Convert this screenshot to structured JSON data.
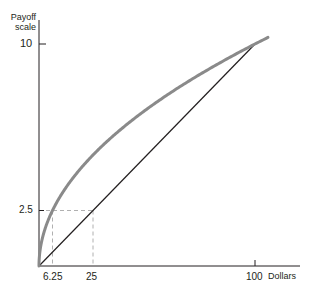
{
  "chart_data": {
    "type": "line",
    "title": "",
    "xlabel": "Dollars",
    "ylabel": "Payoff scale",
    "ylabel_lines": [
      "Payoff",
      "scale"
    ],
    "xlim": [
      0,
      106
    ],
    "ylim": [
      0,
      10.3
    ],
    "x_ticks": [
      "6.25",
      "25",
      "100"
    ],
    "y_ticks": [
      "2.5",
      "10"
    ],
    "grid": false,
    "legend": null,
    "series": [
      {
        "name": "Utility curve (concave, payoff = sqrt(dollars))",
        "style": "thick gray",
        "color": "#8a8a8a",
        "x": [
          0,
          1,
          2,
          4,
          6.25,
          9,
          16,
          25,
          36,
          49,
          64,
          81,
          100,
          106
        ],
        "y": [
          0,
          1,
          1.41,
          2,
          2.5,
          3,
          4,
          5,
          6,
          7,
          8,
          9,
          10,
          10.3
        ]
      },
      {
        "name": "Linear payoff",
        "style": "thin black",
        "color": "#231f20",
        "x": [
          0,
          100
        ],
        "y": [
          0,
          10
        ]
      }
    ],
    "annotations": [
      {
        "type": "dashed-hline",
        "y": 2.5,
        "x_from": 0,
        "x_to": 25
      },
      {
        "type": "dashed-vline",
        "x": 6.25,
        "y_from": 0,
        "y_to": 2.5
      },
      {
        "type": "dashed-vline",
        "x": 25,
        "y_from": 0,
        "y_to": 2.5
      }
    ]
  },
  "labels": {
    "ylabel_line1": "Payoff",
    "ylabel_line2": "scale",
    "xlabel": "Dollars",
    "ytick_10": "10",
    "ytick_2_5": "2.5",
    "xtick_6_25": "6.25",
    "xtick_25": "25",
    "xtick_100": "100"
  },
  "colors": {
    "curve": "#8a8a8a",
    "line": "#231f20",
    "axis": "#231f20",
    "dashed": "#b0b0b0"
  }
}
